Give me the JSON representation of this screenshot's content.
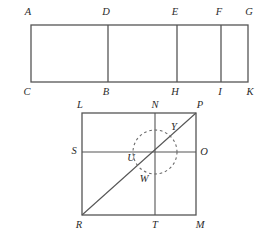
{
  "figure": {
    "stroke_color": "#555555",
    "dash_color": "#6b6b6b",
    "label_color": "#2b2b2b",
    "background": "#ffffff",
    "top_shape": {
      "name": "divided-rectangle",
      "labels": {
        "A": "A",
        "D": "D",
        "E": "E",
        "F": "F",
        "G": "G",
        "C": "C",
        "B": "B",
        "H": "H",
        "I": "I",
        "K": "K"
      },
      "corner_points": [
        "A",
        "G",
        "K",
        "C"
      ],
      "divider_segments": [
        "D-B",
        "E-H",
        "F-I"
      ]
    },
    "bottom_shape": {
      "name": "square-with-diagonal-and-circle",
      "labels": {
        "L": "L",
        "N": "N",
        "P": "P",
        "S": "S",
        "U": "U",
        "Y": "Y",
        "O": "O",
        "W": "W",
        "R": "R",
        "T": "T",
        "M": "M"
      },
      "corner_points": [
        "L",
        "P",
        "M",
        "R"
      ],
      "midline_segments": [
        "N-T",
        "S-O"
      ],
      "diagonal_segment": "R-P",
      "circle": {
        "style": "dashed",
        "through_points": [
          "U",
          "Y",
          "W"
        ]
      }
    }
  }
}
